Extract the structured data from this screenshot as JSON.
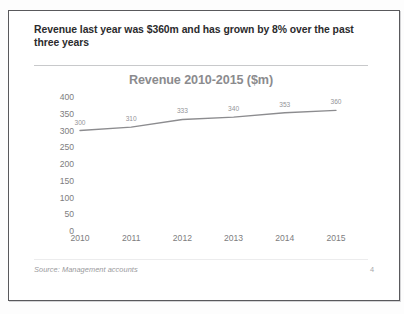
{
  "slide": {
    "headline": "Revenue last year was $360m and has grown by 8% over the past three years",
    "footer_source": "Source: Management accounts",
    "page_number": "4"
  },
  "colors": {
    "frame_border": "#59595c",
    "headline_text": "#2b2b2d",
    "rule": "#c8c9cb",
    "chart_title": "#8b8b8e",
    "axis_label": "#7d7d80",
    "data_label": "#949497",
    "series_line": "#8c8c8f",
    "footer_text": "#9a9a9d"
  },
  "chart_data": {
    "type": "line",
    "title": "Revenue 2010-2015 ($m)",
    "xlabel": "",
    "ylabel": "",
    "categories": [
      "2010",
      "2011",
      "2012",
      "2013",
      "2014",
      "2015"
    ],
    "values": [
      300,
      310,
      333,
      340,
      353,
      360
    ],
    "data_labels": [
      "300",
      "310",
      "333",
      "340",
      "353",
      "360"
    ],
    "ylim": [
      0,
      400
    ],
    "ytick_step": 50,
    "yticks": [
      "400",
      "350",
      "300",
      "250",
      "200",
      "150",
      "100",
      "50",
      "0"
    ],
    "grid": false,
    "legend": false,
    "markers": false,
    "series": [
      {
        "name": "Revenue",
        "values": [
          300,
          310,
          333,
          340,
          353,
          360
        ]
      }
    ]
  }
}
